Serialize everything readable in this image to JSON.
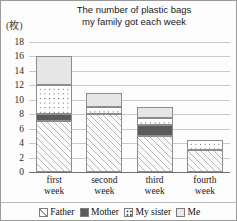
{
  "chart_data": {
    "type": "bar",
    "subtype": "stacked",
    "title": "The number of plastic bags\nmy family got each week",
    "unit_label": "(枚)",
    "xlabel": "",
    "ylabel": "",
    "ylim": [
      0,
      18
    ],
    "ytick_step": 2,
    "yticks": [
      "0",
      "2",
      "4",
      "6",
      "8",
      "10",
      "12",
      "14",
      "16",
      "18"
    ],
    "grid": true,
    "legend_position": "bottom",
    "categories": [
      "first\nweek",
      "second\nweek",
      "third\nweek",
      "fourth\nweek"
    ],
    "series": [
      {
        "name": "Father",
        "swatch": "hatch-diagonal",
        "values": [
          7,
          8,
          5,
          3
        ]
      },
      {
        "name": "Mother",
        "swatch": "solid-dark",
        "values": [
          1,
          0,
          1.5,
          0
        ]
      },
      {
        "name": "My sister",
        "swatch": "dotted",
        "values": [
          4,
          1,
          1,
          1.5
        ]
      },
      {
        "name": "Me",
        "swatch": "solid-light",
        "values": [
          4,
          2,
          1.5,
          0
        ]
      }
    ],
    "totals": [
      16,
      11,
      9,
      4.5
    ],
    "colors": {
      "father": "#fbfbfb",
      "mother": "#5b5b5b",
      "sister": "#ffffff",
      "me": "#e6e6e6",
      "grid": "#c9c9c9",
      "axis": "#6f6f6f",
      "border": "#8d8d8d",
      "frame": "#9a9a9a"
    }
  },
  "legend": {
    "items": [
      {
        "label": "Father"
      },
      {
        "label": "Mother"
      },
      {
        "label": "My sister"
      },
      {
        "label": "Me"
      }
    ]
  }
}
